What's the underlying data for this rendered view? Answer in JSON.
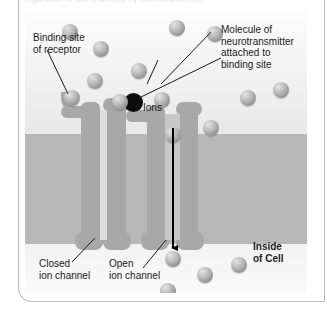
{
  "figure": {
    "title_clipped": "regulation of ion channels by neurotransmitter",
    "labels": {
      "binding_site": "Binding site\nof receptor",
      "ions": "Ions",
      "neurotransmitter": "Molecule of\nneurotransmitter\nattached to\nbinding site",
      "closed_channel": "Closed\nion channel",
      "open_channel": "Open\nion channel",
      "inside_of_cell": "Inside\nof Cell"
    },
    "colors": {
      "membrane": "#b8b8b8",
      "protein": "#a8a8a8",
      "pore_closed": "#dcdcdc",
      "pore_open": "#c8c8c8",
      "neurotransmitter": "#0d0d0d",
      "arrow": "#000000",
      "frame": "#b9b9b9",
      "text": "#1b1b1b"
    },
    "regions": [
      {
        "name": "extracellular-space",
        "top": 0,
        "height": 124
      },
      {
        "name": "membrane-bilayer",
        "top": 124,
        "height": 110
      },
      {
        "name": "intracellular-space",
        "top": 234,
        "height": 49
      }
    ],
    "channels": [
      {
        "name": "closed-ion-channel",
        "state": "closed",
        "pore_width": 7,
        "has_bound_molecule": false
      },
      {
        "name": "open-ion-channel",
        "state": "open",
        "pore_width": 15,
        "has_bound_molecule": true
      }
    ],
    "ions_outside": [
      {
        "cx": 45,
        "cy": 22,
        "r": 8
      },
      {
        "cx": 76,
        "cy": 39,
        "r": 8
      },
      {
        "cx": 152,
        "cy": 18,
        "r": 8
      },
      {
        "cx": 190,
        "cy": 24,
        "r": 8
      },
      {
        "cx": 70,
        "cy": 71,
        "r": 8
      },
      {
        "cx": 114,
        "cy": 61,
        "r": 8
      },
      {
        "cx": 47,
        "cy": 88,
        "r": 8
      },
      {
        "cx": 95,
        "cy": 92,
        "r": 8
      },
      {
        "cx": 137,
        "cy": 90,
        "r": 8
      },
      {
        "cx": 223,
        "cy": 88,
        "r": 8
      },
      {
        "cx": 256,
        "cy": 80,
        "r": 8
      },
      {
        "cx": 186,
        "cy": 118,
        "r": 8
      },
      {
        "cx": 148,
        "cy": 125,
        "r": 8
      }
    ],
    "ions_inside": [
      {
        "cx": 148,
        "cy": 249,
        "r": 8
      },
      {
        "cx": 180,
        "cy": 265,
        "r": 8
      },
      {
        "cx": 214,
        "cy": 255,
        "r": 8
      },
      {
        "cx": 143,
        "cy": 281,
        "r": 8
      }
    ],
    "arrow": {
      "x": 148,
      "from_y": 118,
      "to_y": 243,
      "direction": "down"
    }
  }
}
